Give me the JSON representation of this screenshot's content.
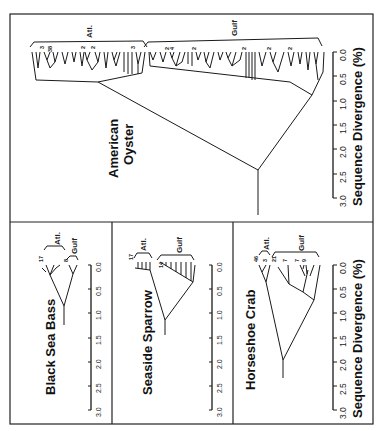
{
  "figure": {
    "orientation": "rotated 90 degrees (text reads bottom-to-top)",
    "axis_label": "Sequence Divergence (%)",
    "ticks": [
      "0.0",
      "0.5",
      "1.0",
      "1.5",
      "2.0",
      "2.5",
      "3.0"
    ]
  },
  "panels": {
    "oyster": {
      "title_line1": "American",
      "title_line2": "Oyster",
      "group_atl": "Atl.",
      "group_gulf": "Gulf",
      "atl_counts": [
        "3",
        "38",
        "2",
        "2",
        "3"
      ],
      "gulf_counts": [
        "2",
        "4",
        "2",
        "2",
        "2",
        "2"
      ],
      "axis_label": "Sequence Divergence (%)"
    },
    "bass": {
      "title": "Black Sea Bass",
      "group_atl": "Atl.",
      "group_gulf": "Gulf",
      "atl_count": "17",
      "gulf_count": "8"
    },
    "sparrow": {
      "title": "Seaside Sparrow",
      "group_atl": "Atl.",
      "group_gulf": "Gulf",
      "atl_count": "17",
      "gulf_count": "14"
    },
    "crab": {
      "title": "Horseshoe Crab",
      "group_atl": "Atl.",
      "group_gulf": "Gulf",
      "atl_counts": [
        "46",
        "3"
      ],
      "gulf_counts": [
        "21",
        "7",
        "7",
        "9"
      ],
      "axis_label": "Sequence Divergence (%)"
    }
  }
}
